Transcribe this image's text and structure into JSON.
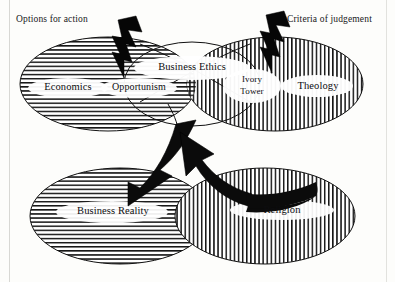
{
  "headers": {
    "left": "Options for action",
    "right": "Criteria of judgement"
  },
  "top_row": {
    "left_ellipse": {
      "label": "Economics",
      "fill": "horizontal-hatch"
    },
    "left_inner": {
      "label": "Opportunism",
      "fill": "cross-hatch"
    },
    "center": {
      "label": "Business Ethics",
      "fill": "cross-hatch"
    },
    "right_inner": {
      "label": "Ivory Tower",
      "line1": "Ivory",
      "line2": "Tower",
      "fill": "cross-hatch"
    },
    "right_ellipse": {
      "label": "Theology",
      "fill": "vertical-hatch"
    }
  },
  "bottom_row": {
    "left_ellipse": {
      "label": "Business Reality",
      "fill": "horizontal-hatch"
    },
    "right_ellipse": {
      "label": "Religion",
      "fill": "vertical-hatch"
    }
  },
  "annotations": {
    "bolt_left": "lightning-bolt",
    "bolt_right": "lightning-bolt",
    "arrow_down_left": "curved-arrow-to-business-reality",
    "arrow_up_right": "curved-arrow-to-business-ethics"
  },
  "colors": {
    "ink": "#0d0d10",
    "hatch": "#1a1a1a",
    "paper": "#fdfdfb",
    "frame": "#d8d8d4"
  }
}
